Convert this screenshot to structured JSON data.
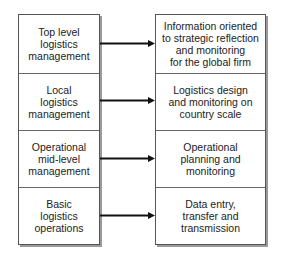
{
  "diagram": {
    "left_column": {
      "items": [
        {
          "label": "Top level\nlogistics\nmanagement"
        },
        {
          "label": "Local\nlogistics\nmanagement"
        },
        {
          "label": "Operational\nmid-level\nmanagement"
        },
        {
          "label": "Basic\nlogistics\noperations"
        }
      ]
    },
    "right_column": {
      "items": [
        {
          "label": "Information oriented\nto strategic reflection\nand monitoring\nfor the global firm"
        },
        {
          "label": "Logistics design\nand monitoring on\ncountry scale"
        },
        {
          "label": "Operational\nplanning and\nmonitoring"
        },
        {
          "label": "Data entry,\ntransfer and\ntransmission"
        }
      ]
    },
    "connectors": [
      {
        "from": "left_column.items.0",
        "to": "right_column.items.0",
        "type": "arrow"
      },
      {
        "from": "left_column.items.1",
        "to": "right_column.items.1",
        "type": "arrow"
      },
      {
        "from": "left_column.items.2",
        "to": "right_column.items.2",
        "type": "arrow"
      },
      {
        "from": "left_column.items.3",
        "to": "right_column.items.3",
        "type": "arrow"
      }
    ],
    "colors": {
      "line": "#111111",
      "border": "#555555",
      "shadow": "#9a9a9a"
    }
  }
}
